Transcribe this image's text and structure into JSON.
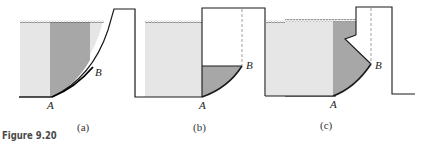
{
  "figure": {
    "title": "Figure 9.20",
    "colors": {
      "water_light": "#e6e6e6",
      "water_dark": "#a7a7a7",
      "line": "#1a1a1a",
      "dashed": "#888888"
    },
    "panels": [
      {
        "caption": "(a)",
        "point_a": "A",
        "point_b": "B"
      },
      {
        "caption": "(b)",
        "point_a": "A",
        "point_b": "B"
      },
      {
        "caption": "(c)",
        "point_a": "A",
        "point_b": "B"
      }
    ]
  }
}
